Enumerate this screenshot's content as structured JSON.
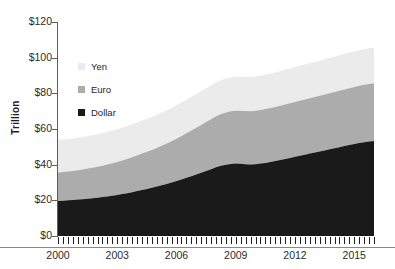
{
  "chart_data": {
    "type": "area",
    "title": "",
    "subtitle": "",
    "xlabel": "",
    "ylabel": "Trillion",
    "stacked": true,
    "grid": false,
    "legend_position": "inside-upper-left",
    "xlim": [
      2000,
      2016
    ],
    "ylim": [
      0,
      120
    ],
    "y_tick_labels": [
      "$0",
      "$20",
      "$40",
      "$60",
      "$80",
      "$100",
      "$120"
    ],
    "y_tick_values": [
      0,
      20,
      40,
      60,
      80,
      100,
      120
    ],
    "x_tick_labels": [
      "2000",
      "2003",
      "2006",
      "2009",
      "2012",
      "2015"
    ],
    "x_tick_values": [
      2000,
      2003,
      2006,
      2009,
      2012,
      2015
    ],
    "x_minor_tick_interval": 0.25,
    "x": [
      2000,
      2000.25,
      2000.5,
      2000.75,
      2001,
      2001.25,
      2001.5,
      2001.75,
      2002,
      2002.25,
      2002.5,
      2002.75,
      2003,
      2003.25,
      2003.5,
      2003.75,
      2004,
      2004.25,
      2004.5,
      2004.75,
      2005,
      2005.25,
      2005.5,
      2005.75,
      2006,
      2006.25,
      2006.5,
      2006.75,
      2007,
      2007.25,
      2007.5,
      2007.75,
      2008,
      2008.25,
      2008.5,
      2008.75,
      2009,
      2009.25,
      2009.5,
      2009.75,
      2010,
      2010.25,
      2010.5,
      2010.75,
      2011,
      2011.25,
      2011.5,
      2011.75,
      2012,
      2012.25,
      2012.5,
      2012.75,
      2013,
      2013.25,
      2013.5,
      2013.75,
      2014,
      2014.25,
      2014.5,
      2014.75,
      2015,
      2015.25,
      2015.5,
      2015.75,
      2016
    ],
    "series": [
      {
        "name": "Dollar",
        "color": "#1a1a1a",
        "values": [
          19.6,
          19.8,
          20.0,
          20.2,
          20.4,
          20.6,
          20.9,
          21.2,
          21.5,
          21.8,
          22.2,
          22.6,
          23.0,
          23.5,
          24.0,
          24.6,
          25.2,
          25.8,
          26.4,
          27.0,
          27.7,
          28.4,
          29.2,
          30.0,
          30.8,
          31.7,
          32.6,
          33.5,
          34.5,
          35.5,
          36.5,
          37.5,
          38.6,
          39.4,
          40.0,
          40.4,
          40.6,
          40.5,
          40.3,
          40.1,
          40.2,
          40.6,
          41.0,
          41.5,
          42.0,
          42.6,
          43.2,
          43.8,
          44.4,
          45.0,
          45.6,
          46.2,
          46.8,
          47.4,
          48.0,
          48.6,
          49.2,
          49.8,
          50.4,
          51.0,
          51.6,
          52.1,
          52.6,
          53.0,
          53.3
        ]
      },
      {
        "name": "Euro",
        "color": "#acacac",
        "values": [
          16.0,
          16.1,
          16.2,
          16.3,
          16.5,
          16.7,
          16.9,
          17.1,
          17.3,
          17.6,
          17.9,
          18.2,
          18.5,
          18.8,
          19.2,
          19.6,
          20.0,
          20.4,
          20.8,
          21.2,
          21.7,
          22.2,
          22.7,
          23.2,
          23.8,
          24.4,
          25.0,
          25.6,
          26.2,
          26.8,
          27.4,
          28.0,
          28.6,
          29.0,
          29.3,
          29.5,
          29.6,
          29.7,
          29.8,
          29.9,
          30.0,
          30.1,
          30.2,
          30.3,
          30.4,
          30.5,
          30.6,
          30.7,
          30.8,
          30.9,
          31.0,
          31.1,
          31.2,
          31.3,
          31.4,
          31.5,
          31.6,
          31.7,
          31.8,
          31.9,
          32.0,
          32.1,
          32.2,
          32.3,
          32.4
        ]
      },
      {
        "name": "Yen",
        "color": "#ebebeb",
        "values": [
          18.2,
          18.2,
          18.2,
          18.2,
          18.2,
          18.2,
          18.2,
          18.3,
          18.3,
          18.3,
          18.3,
          18.3,
          18.4,
          18.4,
          18.4,
          18.4,
          18.5,
          18.5,
          18.5,
          18.5,
          18.6,
          18.6,
          18.6,
          18.6,
          18.7,
          18.7,
          18.7,
          18.8,
          18.8,
          18.8,
          18.9,
          18.9,
          18.9,
          19.0,
          19.0,
          19.0,
          19.1,
          19.1,
          19.1,
          19.2,
          19.2,
          19.2,
          19.3,
          19.3,
          19.3,
          19.4,
          19.4,
          19.4,
          19.5,
          19.5,
          19.5,
          19.6,
          19.6,
          19.6,
          19.7,
          19.7,
          19.7,
          19.8,
          19.8,
          19.8,
          19.9,
          19.9,
          19.9,
          20.0,
          20.0
        ]
      }
    ]
  },
  "legend": {
    "items": [
      {
        "label": "Yen",
        "color": "#ebebeb"
      },
      {
        "label": "Euro",
        "color": "#acacac"
      },
      {
        "label": "Dollar",
        "color": "#1a1a1a"
      }
    ]
  },
  "axes": {
    "y_title": "Trillion",
    "axis_color": "#5c5c5c",
    "baseline_color": "#8a8a8a"
  }
}
